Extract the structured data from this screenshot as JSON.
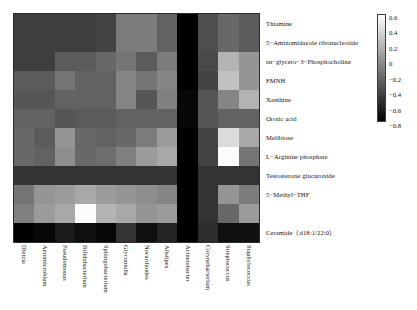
{
  "chart_data": {
    "type": "heatmap",
    "title": "",
    "xlabel": "",
    "ylabel": "",
    "colormap": "grayscale-light-high",
    "grid": false,
    "legend_position": "right",
    "colorbar": {
      "min": -0.8,
      "max": 0.6,
      "ticks": [
        "0.6",
        "0.4",
        "0.2",
        "0",
        "−0.2",
        "−0.4",
        "−0.6",
        "−0.8"
      ],
      "tick_values": [
        0.6,
        0.4,
        0.2,
        0,
        -0.2,
        -0.4,
        -0.6,
        -0.8
      ],
      "high_color": "#ffffff",
      "low_color": "#000000"
    },
    "categories": [
      "Dietzia",
      "Aeromicrobium",
      "Pseudomonas",
      "Bifidobacterium",
      "Sphingobacterium",
      "Glycomulla",
      "Nocardioides",
      "Alistipes",
      "Acinetobacter",
      "Corynebacterium",
      "Streptococcus",
      "Staphylococcus"
    ],
    "rows": [
      "Thiamine",
      "5−Aminomidazole ribonucleotide",
      "sn−glycero−3−Phosphocholine",
      "FMNH",
      "Xanthine",
      "Orotic acid",
      "Melibiose",
      "L−Arginine phosphate",
      "Testosterone glucuronide",
      "5−Methyl−THF",
      "Ceramide（d18:1/22:0）"
    ],
    "row_slots": 12,
    "matrix": [
      [
        -0.46,
        -0.46,
        -0.46,
        -0.46,
        -0.43,
        -0.12,
        -0.12,
        -0.26,
        -0.8,
        -0.37,
        -0.23,
        -0.3
      ],
      [
        -0.46,
        -0.46,
        -0.46,
        -0.46,
        -0.43,
        -0.12,
        -0.12,
        -0.26,
        -0.8,
        -0.37,
        -0.23,
        -0.3
      ],
      [
        -0.46,
        -0.46,
        -0.3,
        -0.3,
        -0.23,
        -0.16,
        -0.3,
        -0.12,
        -0.82,
        -0.4,
        0.18,
        0.02
      ],
      [
        -0.3,
        -0.3,
        -0.16,
        -0.26,
        -0.26,
        -0.07,
        -0.16,
        -0.07,
        -0.8,
        -0.43,
        0.26,
        0.02
      ],
      [
        -0.33,
        -0.33,
        -0.26,
        -0.26,
        -0.26,
        -0.07,
        -0.33,
        -0.1,
        -0.76,
        -0.33,
        -0.07,
        0.18
      ],
      [
        -0.26,
        -0.26,
        -0.33,
        -0.3,
        -0.3,
        -0.26,
        -0.26,
        -0.26,
        -0.76,
        -0.33,
        -0.26,
        -0.26
      ],
      [
        -0.23,
        -0.3,
        0.02,
        -0.23,
        -0.26,
        -0.23,
        -0.12,
        0.05,
        -0.86,
        -0.43,
        0.4,
        0.12
      ],
      [
        -0.23,
        -0.26,
        -0.02,
        -0.23,
        -0.2,
        -0.1,
        0.05,
        0.12,
        -0.86,
        -0.43,
        0.58,
        -0.16
      ],
      [
        -0.52,
        -0.52,
        -0.52,
        -0.52,
        -0.52,
        -0.52,
        -0.52,
        -0.52,
        -0.8,
        -0.52,
        -0.52,
        -0.52
      ],
      [
        -0.16,
        0.02,
        0.05,
        0.12,
        0.05,
        0.02,
        -0.02,
        -0.07,
        -0.8,
        -0.52,
        0.02,
        -0.12
      ],
      [
        -0.1,
        0.05,
        0.12,
        0.58,
        0.18,
        0.12,
        0.02,
        0.05,
        -0.8,
        -0.52,
        -0.23,
        0.05
      ],
      [
        -0.8,
        -0.76,
        -0.66,
        -0.72,
        -0.76,
        -0.52,
        -0.72,
        -0.6,
        -0.8,
        -0.56,
        -0.72,
        -0.72
      ]
    ]
  }
}
